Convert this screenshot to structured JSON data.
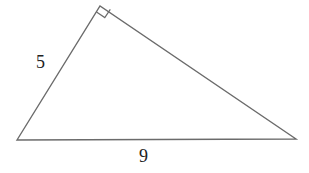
{
  "diagram": {
    "type": "right-triangle",
    "stroke_color": "#6b6b6b",
    "label_color": "#222222",
    "vertices": {
      "bottom_left": [
        17,
        140
      ],
      "apex_right_angle": [
        100,
        6
      ],
      "bottom_right": [
        296,
        139
      ]
    },
    "labels": {
      "leg": "5",
      "base": "9"
    }
  }
}
